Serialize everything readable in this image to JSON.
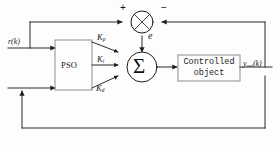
{
  "diagram": {
    "background_color": "#fdfdfd",
    "line_color": "#2b2b2b",
    "box_border_color": "#8d8d8d"
  },
  "signals": {
    "reference_input": "r(k)",
    "error_label": "e",
    "output_label_base": "y",
    "output_label_sub": "out",
    "output_label_tail": "(k)"
  },
  "blocks": {
    "optimizer": {
      "name": "PSO",
      "label": "PSO"
    },
    "plant": {
      "line1": "Controlled",
      "line2": "object"
    },
    "summer": {
      "glyph": "Σ"
    },
    "comparator": {
      "plus_sign": "+",
      "minus_sign": "−"
    }
  },
  "gains": [
    {
      "id": "kp",
      "base": "K",
      "sub": "p"
    },
    {
      "id": "ki",
      "base": "K",
      "sub": "i"
    },
    {
      "id": "kd",
      "base": "K",
      "sub": "d"
    }
  ]
}
